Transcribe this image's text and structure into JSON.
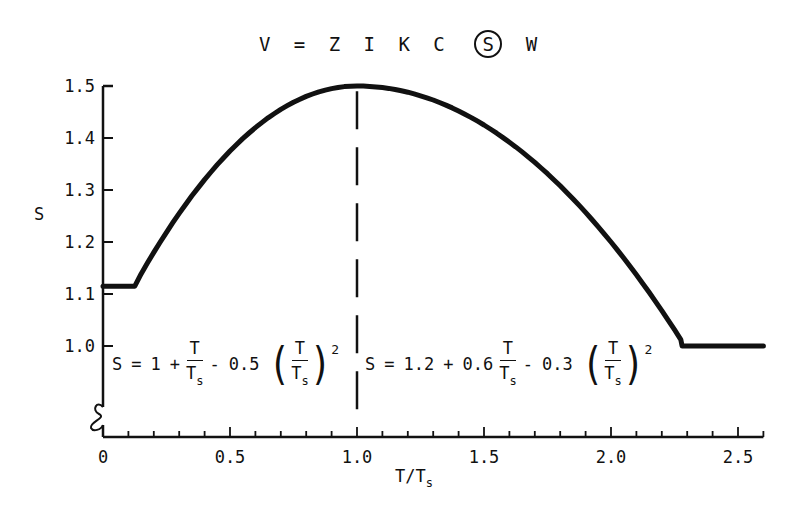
{
  "title": {
    "pre": "V = Z I K C",
    "circled": "S",
    "post": "W"
  },
  "axes": {
    "ylabel": "S",
    "xlabel_main": "T/T",
    "xlabel_sub": "s"
  },
  "equations": {
    "left": {
      "s": "S",
      "eq": "=",
      "c": "1",
      "plus": "+",
      "num": "T",
      "den": "T",
      "den_sub": "s",
      "minus": "-",
      "coef": "0.5",
      "pnum": "T",
      "pden": "T",
      "pden_sub": "s",
      "exp": "2"
    },
    "right": {
      "s": "S",
      "eq": "=",
      "c": "1.2",
      "plus": "+",
      "coef1": "0.6",
      "num": "T",
      "den": "T",
      "den_sub": "s",
      "minus": "-",
      "coef2": "0.3",
      "pnum": "T",
      "pden": "T",
      "pden_sub": "s",
      "exp": "2"
    }
  },
  "chart_data": {
    "type": "line",
    "xlabel": "T/Ts",
    "ylabel": "S",
    "xlim": [
      0,
      2.6
    ],
    "ylim": [
      1.0,
      1.5
    ],
    "y_axis_break": true,
    "grid": false,
    "xticks": [
      0,
      0.5,
      1.0,
      1.5,
      2.0,
      2.5
    ],
    "xtick_labels": [
      "0",
      "0.5",
      "1.0",
      "1.5",
      "2.0",
      "2.5"
    ],
    "x_minor_tick_step": 0.1,
    "yticks": [
      1.0,
      1.1,
      1.2,
      1.3,
      1.4,
      1.5
    ],
    "ytick_labels": [
      "1.0",
      "1.1",
      "1.2",
      "1.3",
      "1.4",
      "1.5"
    ],
    "divider": {
      "x": 1.0,
      "style": "dashed"
    },
    "segments": [
      {
        "name": "plateau",
        "x_range": [
          0,
          0.125
        ],
        "S": 1.115
      },
      {
        "name": "left_formula",
        "x_range": [
          0.125,
          1.0
        ],
        "formula": "S = 1 + T/Ts - 0.5 (T/Ts)^2"
      },
      {
        "name": "right_formula",
        "x_range": [
          1.0,
          2.28
        ],
        "formula": "S = 1.2 + 0.6 T/Ts - 0.3 (T/Ts)^2"
      },
      {
        "name": "floor",
        "x_range": [
          2.28,
          2.6
        ],
        "S": 1.0
      }
    ],
    "series": [
      {
        "name": "S",
        "x": [
          0,
          0.125,
          0.2,
          0.3,
          0.4,
          0.5,
          0.6,
          0.7,
          0.8,
          0.9,
          1.0,
          1.1,
          1.2,
          1.3,
          1.4,
          1.5,
          1.6,
          1.7,
          1.8,
          1.9,
          2.0,
          2.1,
          2.2,
          2.28,
          2.4,
          2.5,
          2.6
        ],
        "y": [
          1.115,
          1.117,
          1.18,
          1.255,
          1.32,
          1.375,
          1.42,
          1.455,
          1.48,
          1.495,
          1.5,
          1.497,
          1.488,
          1.473,
          1.452,
          1.425,
          1.392,
          1.353,
          1.308,
          1.257,
          1.2,
          1.137,
          1.068,
          1.009,
          1.0,
          1.0,
          1.0
        ]
      }
    ]
  }
}
